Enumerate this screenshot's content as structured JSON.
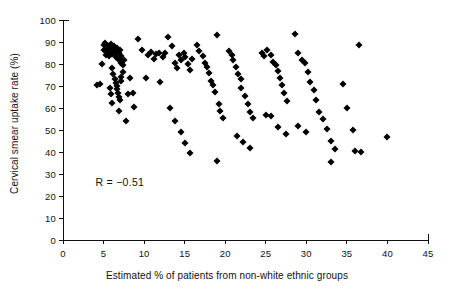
{
  "chart_data": {
    "type": "scatter",
    "title": "",
    "xlabel": "Estimated % of patients from non-white ethnic groups",
    "ylabel": "Cervical smear uptake rate (%)",
    "xlim": [
      0,
      45
    ],
    "ylim": [
      0,
      100
    ],
    "xticks": [
      0,
      5,
      10,
      15,
      20,
      25,
      30,
      35,
      40,
      45
    ],
    "yticks": [
      0,
      10,
      20,
      30,
      40,
      50,
      60,
      70,
      80,
      90,
      100
    ],
    "grid": false,
    "legend": null,
    "annotations": [
      {
        "text": "R = −0.51",
        "x": 4.0,
        "y": 26.5
      }
    ],
    "marker": {
      "shape": "diamond",
      "color": "#000000",
      "size": 5
    },
    "correlation": -0.51,
    "n_points": 141,
    "points": [
      [
        4.2,
        70.5
      ],
      [
        4.6,
        71.0
      ],
      [
        4.8,
        80.0
      ],
      [
        5.0,
        88.5
      ],
      [
        5.1,
        86.5
      ],
      [
        5.2,
        89.5
      ],
      [
        5.3,
        84.0
      ],
      [
        5.4,
        87.0
      ],
      [
        5.5,
        85.5
      ],
      [
        5.6,
        88.0
      ],
      [
        5.7,
        83.5
      ],
      [
        5.8,
        86.0
      ],
      [
        5.9,
        89.0
      ],
      [
        6.0,
        87.5
      ],
      [
        6.1,
        84.5
      ],
      [
        6.2,
        86.8
      ],
      [
        6.3,
        88.2
      ],
      [
        6.4,
        85.0
      ],
      [
        6.5,
        83.0
      ],
      [
        6.6,
        87.2
      ],
      [
        6.7,
        85.8
      ],
      [
        6.8,
        82.5
      ],
      [
        6.9,
        84.8
      ],
      [
        7.0,
        86.2
      ],
      [
        7.1,
        80.5
      ],
      [
        7.2,
        83.8
      ],
      [
        7.3,
        81.5
      ],
      [
        7.4,
        79.5
      ],
      [
        7.5,
        82.0
      ],
      [
        6.0,
        78.0
      ],
      [
        6.2,
        75.5
      ],
      [
        6.4,
        73.0
      ],
      [
        6.5,
        71.5
      ],
      [
        6.6,
        70.0
      ],
      [
        6.7,
        68.5
      ],
      [
        6.8,
        67.0
      ],
      [
        6.9,
        65.0
      ],
      [
        7.0,
        63.5
      ],
      [
        7.1,
        72.5
      ],
      [
        7.2,
        74.0
      ],
      [
        7.4,
        76.5
      ],
      [
        5.8,
        69.0
      ],
      [
        5.9,
        66.5
      ],
      [
        6.1,
        62.5
      ],
      [
        6.9,
        58.5
      ],
      [
        7.8,
        54.0
      ],
      [
        8.0,
        66.5
      ],
      [
        8.6,
        67.0
      ],
      [
        8.2,
        73.5
      ],
      [
        8.8,
        60.5
      ],
      [
        9.3,
        91.5
      ],
      [
        9.8,
        86.5
      ],
      [
        10.2,
        73.5
      ],
      [
        10.5,
        84.0
      ],
      [
        10.9,
        85.5
      ],
      [
        11.2,
        82.5
      ],
      [
        11.5,
        84.5
      ],
      [
        11.8,
        85.0
      ],
      [
        12.0,
        72.0
      ],
      [
        12.3,
        83.0
      ],
      [
        12.6,
        85.2
      ],
      [
        13.0,
        92.5
      ],
      [
        13.4,
        88.0
      ],
      [
        13.8,
        80.5
      ],
      [
        14.0,
        78.0
      ],
      [
        14.3,
        84.0
      ],
      [
        14.6,
        82.0
      ],
      [
        14.9,
        85.0
      ],
      [
        15.1,
        83.0
      ],
      [
        15.4,
        80.0
      ],
      [
        15.7,
        77.5
      ],
      [
        15.9,
        82.5
      ],
      [
        13.2,
        60.0
      ],
      [
        13.8,
        54.0
      ],
      [
        14.5,
        49.0
      ],
      [
        15.0,
        44.0
      ],
      [
        15.6,
        39.5
      ],
      [
        16.5,
        88.5
      ],
      [
        16.8,
        86.0
      ],
      [
        17.2,
        83.5
      ],
      [
        17.5,
        80.5
      ],
      [
        17.8,
        78.5
      ],
      [
        18.0,
        76.0
      ],
      [
        18.3,
        72.5
      ],
      [
        18.5,
        70.5
      ],
      [
        18.7,
        67.5
      ],
      [
        19.0,
        93.0
      ],
      [
        19.2,
        62.0
      ],
      [
        19.0,
        36.0
      ],
      [
        19.4,
        58.5
      ],
      [
        19.7,
        55.5
      ],
      [
        20.5,
        86.0
      ],
      [
        20.8,
        84.0
      ],
      [
        21.0,
        82.0
      ],
      [
        21.3,
        78.5
      ],
      [
        21.6,
        75.5
      ],
      [
        21.9,
        73.0
      ],
      [
        22.0,
        69.0
      ],
      [
        22.4,
        65.5
      ],
      [
        22.8,
        62.0
      ],
      [
        23.0,
        58.0
      ],
      [
        23.4,
        55.5
      ],
      [
        21.5,
        47.5
      ],
      [
        22.2,
        44.5
      ],
      [
        23.0,
        42.0
      ],
      [
        24.5,
        85.0
      ],
      [
        24.8,
        83.5
      ],
      [
        25.2,
        86.5
      ],
      [
        25.6,
        84.0
      ],
      [
        25.9,
        81.0
      ],
      [
        26.2,
        79.5
      ],
      [
        26.5,
        77.0
      ],
      [
        26.8,
        73.5
      ],
      [
        27.0,
        70.5
      ],
      [
        27.3,
        67.0
      ],
      [
        27.6,
        63.0
      ],
      [
        25.0,
        57.0
      ],
      [
        25.6,
        56.5
      ],
      [
        26.5,
        51.5
      ],
      [
        27.5,
        48.0
      ],
      [
        28.6,
        93.5
      ],
      [
        29.0,
        85.0
      ],
      [
        29.5,
        82.0
      ],
      [
        29.8,
        80.5
      ],
      [
        30.2,
        76.5
      ],
      [
        30.5,
        72.0
      ],
      [
        30.9,
        68.0
      ],
      [
        31.2,
        63.5
      ],
      [
        29.0,
        52.0
      ],
      [
        30.0,
        49.0
      ],
      [
        31.5,
        58.0
      ],
      [
        32.0,
        55.0
      ],
      [
        32.5,
        50.5
      ],
      [
        33.0,
        45.0
      ],
      [
        33.5,
        41.5
      ],
      [
        33.0,
        35.5
      ],
      [
        34.5,
        71.0
      ],
      [
        35.0,
        60.0
      ],
      [
        35.8,
        50.0
      ],
      [
        36.0,
        40.5
      ],
      [
        36.5,
        88.5
      ],
      [
        36.8,
        40.0
      ],
      [
        40.0,
        47.0
      ]
    ]
  }
}
